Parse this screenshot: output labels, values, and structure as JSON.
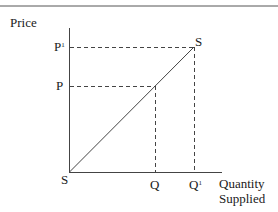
{
  "diagram": {
    "y_axis_label": "Price",
    "x_axis_label_line1": "Quantity",
    "x_axis_label_line2": "Supplied",
    "curve_label_top": "S",
    "curve_label_origin": "S",
    "price_levels": [
      {
        "label": "P",
        "prime": "1"
      },
      {
        "label": "P",
        "prime": ""
      }
    ],
    "quantity_levels": [
      {
        "label": "Q",
        "prime": ""
      },
      {
        "label": "Q",
        "prime": "1"
      }
    ],
    "colors": {
      "line": "#333333",
      "text": "#1a1a1a",
      "background": "#ffffff"
    }
  }
}
